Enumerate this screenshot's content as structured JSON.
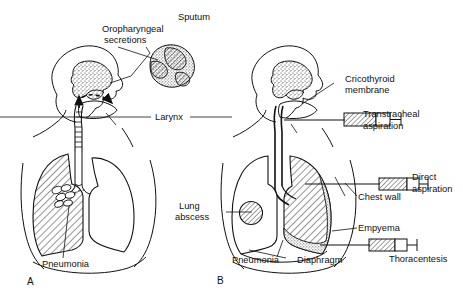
{
  "figure": {
    "type": "medical-line-diagram",
    "background": "#ffffff",
    "ink": "#111111",
    "panels": [
      {
        "letter": "A",
        "name": "panel-a",
        "subject": "Upper airway and lungs with pneumonia; non-invasive specimen sources",
        "labels": [
          "Oropharyngeal secretions",
          "Sputum",
          "Larynx",
          "Pneumonia"
        ]
      },
      {
        "letter": "B",
        "name": "panel-b",
        "subject": "Invasive specimen collection routes with lung abscess, pneumonia and empyema",
        "labels": [
          "Cricothyroid membrane",
          "Transtracheal aspiration",
          "Lung abscess",
          "Direct aspiration",
          "Chest wall",
          "Empyema",
          "Thoracentesis",
          "Pneumonia",
          "Diaphragm"
        ]
      }
    ]
  },
  "labels": {
    "oropharyngeal_line1": "Oropharyngeal",
    "oropharyngeal_line2": "secretions",
    "sputum": "Sputum",
    "larynx": "Larynx",
    "pneumonia_a": "Pneumonia",
    "panel_a": "A",
    "cricothyroid_line1": "Cricothyroid",
    "cricothyroid_line2": "membrane",
    "transtracheal_line1": "Transtracheal",
    "transtracheal_line2": "aspiration",
    "lung_abscess_line1": "Lung",
    "lung_abscess_line2": "abscess",
    "direct_line1": "Direct",
    "direct_line2": "aspiration",
    "chest_wall": "Chest wall",
    "empyema": "Empyema",
    "thoracentesis": "Thoracentesis",
    "pneumonia_b": "Pneumonia",
    "diaphragm": "Diaphragm",
    "panel_b": "B"
  }
}
